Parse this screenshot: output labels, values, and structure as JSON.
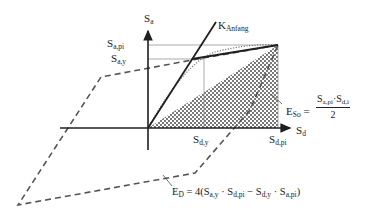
{
  "diagram": {
    "type": "capacity-spectrum / hysteresis energy diagram",
    "axes": {
      "vertical": {
        "symbol": "S",
        "subscript": "a"
      },
      "horizontal": {
        "symbol": "S",
        "subscript": "d"
      }
    },
    "tick_labels": {
      "sa_pi": {
        "symbol": "S",
        "subscript": "a,pi"
      },
      "sa_y": {
        "symbol": "S",
        "subscript": "a,y"
      },
      "sd_y": {
        "symbol": "S",
        "subscript": "d,y"
      },
      "sd_pi": {
        "symbol": "S",
        "subscript": "d,pi"
      }
    },
    "curve_labels": {
      "k_anfang": {
        "symbol": "K",
        "subscript": "Anfang"
      }
    },
    "equations": {
      "eso": {
        "lhs_symbol": "E",
        "lhs_subscript": "So",
        "equals": "=",
        "numerator_a": "S",
        "numerator_a_sub": "a,pi",
        "dot": "·",
        "numerator_b": "S",
        "numerator_b_sub": "d,i",
        "denominator": "2"
      },
      "ed": {
        "lhs_symbol": "E",
        "lhs_subscript": "D",
        "rhs_prefix": "= 4(",
        "t1": "S",
        "t1_sub": "a,y",
        "dot1": " · ",
        "t2": "S",
        "t2_sub": "d,pi",
        "minus": " − ",
        "t3": "S",
        "t3_sub": "d,y",
        "dot2": " · ",
        "t4": "S",
        "t4_sub": "a,pi",
        "close": ")"
      }
    },
    "colors": {
      "line": "#1f1f1f",
      "dashed": "#555555",
      "guide": "#888888",
      "hatch": "#444444"
    }
  }
}
